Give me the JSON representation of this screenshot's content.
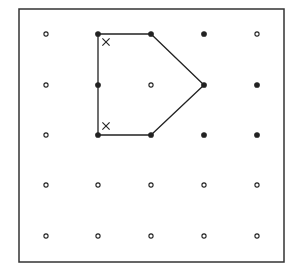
{
  "diagram": {
    "type": "geoboard-dot-grid",
    "grid": {
      "columns": 5,
      "rows": 5
    },
    "colors": {
      "ink": "#222222",
      "background": "#ffffff",
      "frame": "#333333"
    },
    "polygon": {
      "name": "pentagon",
      "vertices": [
        [
          1,
          0
        ],
        [
          2,
          0
        ],
        [
          3,
          1
        ],
        [
          2,
          2
        ],
        [
          1,
          2
        ]
      ],
      "points_on_boundary": [
        [
          1,
          0
        ],
        [
          2,
          0
        ],
        [
          3,
          1
        ],
        [
          2,
          2
        ],
        [
          1,
          2
        ],
        [
          1,
          1
        ]
      ]
    },
    "filled_dots": [
      [
        1,
        0
      ],
      [
        2,
        0
      ],
      [
        3,
        0
      ],
      [
        1,
        1
      ],
      [
        3,
        1
      ],
      [
        4,
        1
      ],
      [
        1,
        2
      ],
      [
        2,
        2
      ],
      [
        3,
        2
      ],
      [
        4,
        2
      ]
    ],
    "angle_marks": [
      {
        "symbol": "×",
        "at_vertex": [
          1,
          0
        ],
        "label": "right-angle-mark-top"
      },
      {
        "symbol": "×",
        "at_vertex": [
          1,
          2
        ],
        "label": "right-angle-mark-bottom"
      }
    ]
  }
}
